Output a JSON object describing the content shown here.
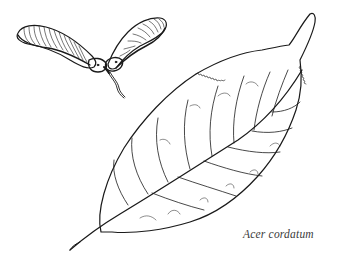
{
  "illustration": {
    "subject": "botanical line drawing of samara fruit and leaf",
    "elements": [
      "samara-fruit",
      "leaf"
    ],
    "ink_color": "#1a1a1a",
    "background_color": "#ffffff"
  },
  "caption": {
    "text": "Acer cordatum"
  }
}
